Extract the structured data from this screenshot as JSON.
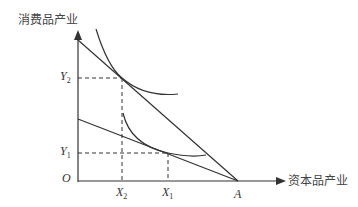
{
  "diagram": {
    "y_axis_label": "消费品产业",
    "x_axis_label": "资本品产业",
    "origin_label": "O",
    "point_A_label": "A",
    "y_ticks": [
      {
        "base": "Y",
        "sub": "2"
      },
      {
        "base": "Y",
        "sub": "1"
      }
    ],
    "x_ticks": [
      {
        "base": "X",
        "sub": "2"
      },
      {
        "base": "X",
        "sub": "1"
      }
    ],
    "colors": {
      "line": "#333333",
      "text": "#333333",
      "background": "#ffffff"
    }
  }
}
